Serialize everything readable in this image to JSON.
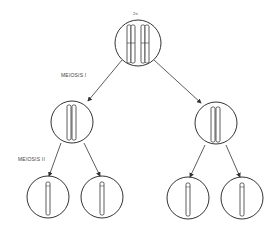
{
  "diagram": {
    "title": "Meiosis",
    "top_label": "2n",
    "stage_labels": {
      "meiosis_1": "MEIOSIS I",
      "meiosis_2": "MEIOSIS II"
    },
    "cells": [
      {
        "id": "parent",
        "level": 0,
        "chromosomes": 2,
        "chromatids_each": 2
      },
      {
        "id": "daughter-left",
        "level": 1,
        "chromosomes": 1,
        "chromatids_each": 2
      },
      {
        "id": "daughter-right",
        "level": 1,
        "chromosomes": 1,
        "chromatids_each": 2
      },
      {
        "id": "gamete-1",
        "level": 2,
        "chromosomes": 1,
        "chromatids_each": 1
      },
      {
        "id": "gamete-2",
        "level": 2,
        "chromosomes": 1,
        "chromatids_each": 1
      },
      {
        "id": "gamete-3",
        "level": 2,
        "chromosomes": 1,
        "chromatids_each": 1
      },
      {
        "id": "gamete-4",
        "level": 2,
        "chromosomes": 1,
        "chromatids_each": 1
      }
    ],
    "colors": {
      "line": "#333333",
      "background": "#ffffff"
    }
  }
}
